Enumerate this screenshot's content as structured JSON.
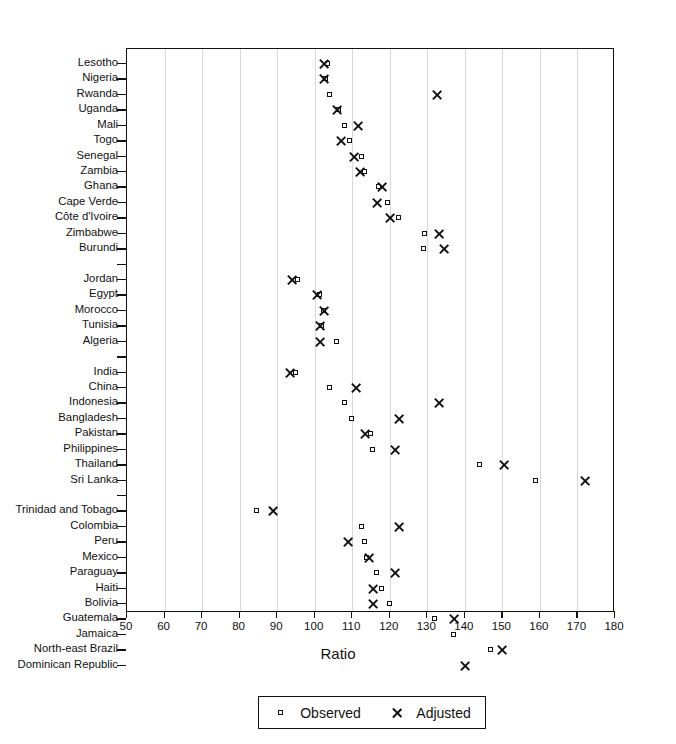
{
  "chart_data": {
    "type": "scatter",
    "title": "",
    "xlabel": "Ratio",
    "ylabel": "",
    "xlim": [
      50,
      180
    ],
    "xticks": [
      50,
      60,
      70,
      80,
      90,
      100,
      110,
      120,
      130,
      140,
      150,
      160,
      170,
      180
    ],
    "grid": "vertical",
    "legend_position": "bottom-center",
    "series": [
      {
        "name": "Observed",
        "marker": "small-open-square"
      },
      {
        "name": "Adjusted",
        "marker": "x-cross"
      }
    ],
    "categories": [
      "Lesotho",
      "Nigeria",
      "Rwanda",
      "Uganda",
      "Mali",
      "Togo",
      "Senegal",
      "Zambia",
      "Ghana",
      "Cape Verde",
      "Côte d'Ivoire",
      "Zimbabwe",
      "Burundi",
      "",
      "Jordan",
      "Egypt",
      "Morocco",
      "Tunisia",
      "Algeria",
      "",
      "India",
      "China",
      "Indonesia",
      "Bangladesh",
      "Pakistan",
      "Philippines",
      "Thailand",
      "Sri Lanka",
      "",
      "Trinidad and Tobago",
      "Colombia",
      "Peru",
      "Mexico",
      "Paraguay",
      "Haiti",
      "Bolivia",
      "Guatemala",
      "Jamaica",
      "North-east Brazil",
      "Dominican Republic"
    ],
    "points": [
      {
        "label": "Lesotho",
        "observed": 103.5,
        "adjusted": 102.5
      },
      {
        "label": "Nigeria",
        "observed": 103.0,
        "adjusted": 102.5
      },
      {
        "label": "Rwanda",
        "observed": 104.0,
        "adjusted": 132.5
      },
      {
        "label": "Uganda",
        "observed": 106.5,
        "adjusted": 106.0
      },
      {
        "label": "Mali",
        "observed": 108.0,
        "adjusted": 111.5
      },
      {
        "label": "Togo",
        "observed": 109.5,
        "adjusted": 107.0
      },
      {
        "label": "Senegal",
        "observed": 112.5,
        "adjusted": 110.5
      },
      {
        "label": "Zambia",
        "observed": 113.5,
        "adjusted": 112.0
      },
      {
        "label": "Ghana",
        "observed": 117.0,
        "adjusted": 118.0
      },
      {
        "label": "Cape Verde",
        "observed": 119.5,
        "adjusted": 116.5
      },
      {
        "label": "Côte d'Ivoire",
        "observed": 122.5,
        "adjusted": 120.0
      },
      {
        "label": "Zimbabwe",
        "observed": 129.5,
        "adjusted": 133.0
      },
      {
        "label": "Burundi",
        "observed": 129.0,
        "adjusted": 134.5
      },
      {
        "label": "Jordan",
        "observed": 95.5,
        "adjusted": 94.0
      },
      {
        "label": "Egypt",
        "observed": 101.5,
        "adjusted": 100.5
      },
      {
        "label": "Morocco",
        "observed": 102.5,
        "adjusted": 102.5
      },
      {
        "label": "Tunisia",
        "observed": 102.0,
        "adjusted": 101.5
      },
      {
        "label": "Algeria",
        "observed": 106.0,
        "adjusted": 101.5
      },
      {
        "label": "India",
        "observed": 95.0,
        "adjusted": 93.5
      },
      {
        "label": "China",
        "observed": 104.0,
        "adjusted": 111.0
      },
      {
        "label": "Indonesia",
        "observed": 108.0,
        "adjusted": 133.0
      },
      {
        "label": "Bangladesh",
        "observed": 110.0,
        "adjusted": 122.5
      },
      {
        "label": "Pakistan",
        "observed": 115.0,
        "adjusted": 113.5
      },
      {
        "label": "Philippines",
        "observed": 115.5,
        "adjusted": 121.5
      },
      {
        "label": "Thailand",
        "observed": 144.0,
        "adjusted": 150.5
      },
      {
        "label": "Sri Lanka",
        "observed": 159.0,
        "adjusted": 172.0
      },
      {
        "label": "Trinidad and Tobago",
        "observed": 84.5,
        "adjusted": 89.0
      },
      {
        "label": "Colombia",
        "observed": 112.5,
        "adjusted": 122.5
      },
      {
        "label": "Peru",
        "observed": 113.5,
        "adjusted": 109.0
      },
      {
        "label": "Mexico",
        "observed": 114.0,
        "adjusted": 114.5
      },
      {
        "label": "Paraguay",
        "observed": 116.5,
        "adjusted": 121.5
      },
      {
        "label": "Haiti",
        "observed": 118.0,
        "adjusted": 115.5
      },
      {
        "label": "Bolivia",
        "observed": 120.0,
        "adjusted": 115.5
      },
      {
        "label": "Guatemala",
        "observed": 132.0,
        "adjusted": 137.0
      },
      {
        "label": "Jamaica",
        "observed": 137.0,
        "adjusted": null
      },
      {
        "label": "North-east Brazil",
        "observed": 147.0,
        "adjusted": 150.0
      },
      {
        "label": "Dominican Republic",
        "observed": null,
        "adjusted": 140.0
      }
    ]
  },
  "legend": {
    "observed_label": "Observed",
    "adjusted_label": "Adjusted"
  }
}
